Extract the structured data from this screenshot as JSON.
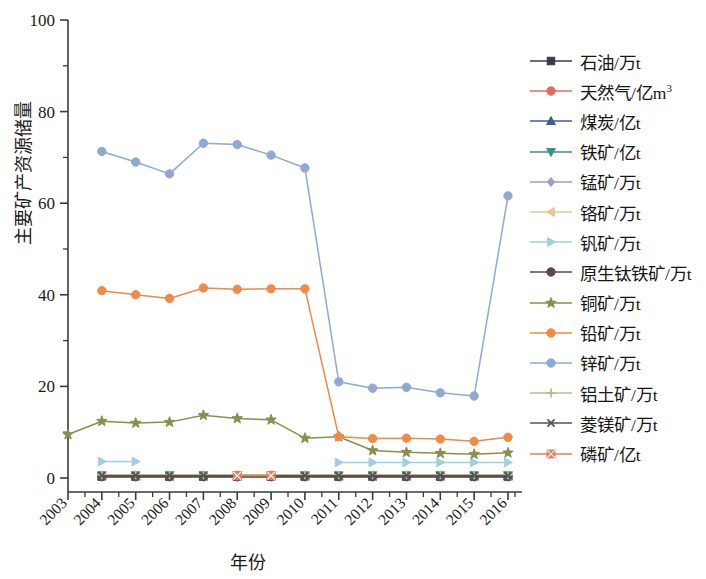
{
  "chart_data": {
    "type": "line",
    "title": "",
    "xlabel": "年份",
    "ylabel": "主要矿产资源储量",
    "grid": false,
    "legend_position": "right",
    "x": [
      "2003",
      "2004",
      "2005",
      "2006",
      "2007",
      "2008",
      "2009",
      "2010",
      "2011",
      "2012",
      "2013",
      "2014",
      "2015",
      "2016"
    ],
    "xtick_labels": [
      "2003",
      "2004",
      "2005",
      "2006",
      "2007",
      "2008",
      "2009",
      "2010",
      "2011",
      "2012",
      "2013",
      "2014",
      "2015",
      "2016"
    ],
    "ytick_labels": [
      "0",
      "20",
      "40",
      "60",
      "80",
      "100"
    ],
    "yticks": [
      0,
      20,
      40,
      60,
      80,
      100
    ],
    "ylim": [
      0,
      100
    ],
    "xlim": [
      2003,
      2016
    ],
    "series": [
      {
        "name": "石油/万t",
        "color": "#3b3b4f",
        "marker": "square",
        "values": [
          null,
          0.3,
          0.3,
          0.3,
          0.3,
          0.3,
          0.3,
          0.3,
          0.3,
          0.3,
          0.3,
          0.3,
          0.3,
          0.3
        ]
      },
      {
        "name": "天然气/亿m³",
        "color": "#e8685d",
        "marker": "circle",
        "values": [
          null,
          0.3,
          0.3,
          0.3,
          0.3,
          0.3,
          0.3,
          0.3,
          0.3,
          0.3,
          0.3,
          0.3,
          0.3,
          0.3
        ]
      },
      {
        "name": "煤炭/亿t",
        "color": "#3f5b96",
        "marker": "triangle-up",
        "values": [
          null,
          0.4,
          0.4,
          0.4,
          0.4,
          0.4,
          0.4,
          0.4,
          0.4,
          0.4,
          0.4,
          0.4,
          0.4,
          0.4
        ]
      },
      {
        "name": "铁矿/亿t",
        "color": "#389489",
        "marker": "triangle-down",
        "values": [
          null,
          0.6,
          0.6,
          0.6,
          0.6,
          0.6,
          0.6,
          0.6,
          0.6,
          0.6,
          0.6,
          0.6,
          0.6,
          0.6
        ]
      },
      {
        "name": "锰矿/万t",
        "color": "#a999c4",
        "marker": "diamond",
        "values": [
          null,
          0.5,
          0.5,
          0.5,
          0.5,
          0.5,
          0.5,
          0.5,
          0.5,
          0.5,
          0.5,
          0.5,
          0.5,
          0.5
        ]
      },
      {
        "name": "铬矿/万t",
        "color": "#e8c98a",
        "marker": "triangle-left",
        "values": [
          null,
          0.4,
          0.4,
          0.4,
          0.4,
          0.4,
          0.4,
          0.4,
          0.4,
          0.4,
          0.4,
          0.4,
          0.4,
          0.4
        ]
      },
      {
        "name": "钒矿/万t",
        "color": "#9ecfe4",
        "marker": "triangle-right",
        "values": [
          null,
          3.6,
          3.6,
          null,
          null,
          null,
          null,
          null,
          3.4,
          3.4,
          3.4,
          3.4,
          3.4,
          3.4
        ]
      },
      {
        "name": "原生钛铁矿/万t",
        "color": "#5a4a47",
        "marker": "circle",
        "values": [
          null,
          0.3,
          0.3,
          0.3,
          0.3,
          0.3,
          0.3,
          0.3,
          0.3,
          0.3,
          0.3,
          0.3,
          0.3,
          0.3
        ]
      },
      {
        "name": "铜矿/万t",
        "color": "#8a8f4d",
        "marker": "star",
        "values": [
          9.5,
          12.4,
          12.0,
          12.2,
          13.7,
          13.0,
          12.7,
          8.7,
          9.0,
          6.0,
          5.6,
          5.4,
          5.2,
          5.5
        ]
      },
      {
        "name": "铅矿/万t",
        "color": "#f08a47",
        "marker": "circle",
        "values": [
          null,
          40.9,
          40.0,
          39.2,
          41.5,
          41.2,
          41.3,
          41.3,
          9.0,
          8.6,
          8.7,
          8.5,
          8.0,
          8.9
        ]
      },
      {
        "name": "锌矿/万t",
        "color": "#8fa8d4",
        "marker": "circle",
        "values": [
          null,
          71.3,
          69.0,
          66.4,
          73.1,
          72.8,
          70.5,
          67.7,
          21.0,
          19.6,
          19.8,
          18.6,
          17.9,
          61.6
        ]
      },
      {
        "name": "铝土矿/万t",
        "color": "#b3c08a",
        "marker": "plus",
        "values": [
          null,
          0.7,
          0.7,
          0.7,
          0.7,
          0.7,
          0.7,
          0.7,
          0.7,
          0.7,
          0.7,
          0.7,
          0.7,
          0.7
        ]
      },
      {
        "name": "菱镁矿/万t",
        "color": "#555555",
        "marker": "x",
        "values": [
          null,
          0.5,
          0.5,
          0.5,
          0.5,
          0.5,
          0.5,
          0.5,
          0.5,
          0.5,
          0.5,
          0.5,
          0.5,
          0.5
        ]
      },
      {
        "name": "磷矿/亿t",
        "color": "#ec7a56",
        "marker": "x-square",
        "values": [
          null,
          null,
          null,
          null,
          null,
          0.5,
          0.5,
          null,
          null,
          null,
          null,
          null,
          null,
          null
        ]
      }
    ]
  },
  "legend": {
    "items": [
      {
        "label": "石油/万t",
        "color": "#3b3b4f",
        "marker": "square"
      },
      {
        "label": "天然气/亿m3",
        "label_base": "天然气/亿m",
        "label_sup": "3",
        "color": "#e8685d",
        "marker": "circle"
      },
      {
        "label": "煤炭/亿t",
        "color": "#3f5b96",
        "marker": "triangle-up"
      },
      {
        "label": "铁矿/亿t",
        "color": "#389489",
        "marker": "triangle-down"
      },
      {
        "label": "锰矿/万t",
        "color": "#a999c4",
        "marker": "diamond"
      },
      {
        "label": "铬矿/万t",
        "color": "#e8c98a",
        "marker": "triangle-left"
      },
      {
        "label": "钒矿/万t",
        "color": "#9ecfe4",
        "marker": "triangle-right"
      },
      {
        "label": "原生钛铁矿/万t",
        "color": "#5a4a47",
        "marker": "circle"
      },
      {
        "label": "铜矿/万t",
        "color": "#8a8f4d",
        "marker": "star"
      },
      {
        "label": "铅矿/万t",
        "color": "#f08a47",
        "marker": "circle"
      },
      {
        "label": "锌矿/万t",
        "color": "#8fa8d4",
        "marker": "circle"
      },
      {
        "label": "铝土矿/万t",
        "color": "#b3c08a",
        "marker": "plus"
      },
      {
        "label": "菱镁矿/万t",
        "color": "#555555",
        "marker": "x"
      },
      {
        "label": "磷矿/亿t",
        "color": "#ec7a56",
        "marker": "x-square"
      }
    ]
  },
  "axes": {
    "axis_color": "#3a3a3a",
    "text_color": "#1a1a1a"
  }
}
